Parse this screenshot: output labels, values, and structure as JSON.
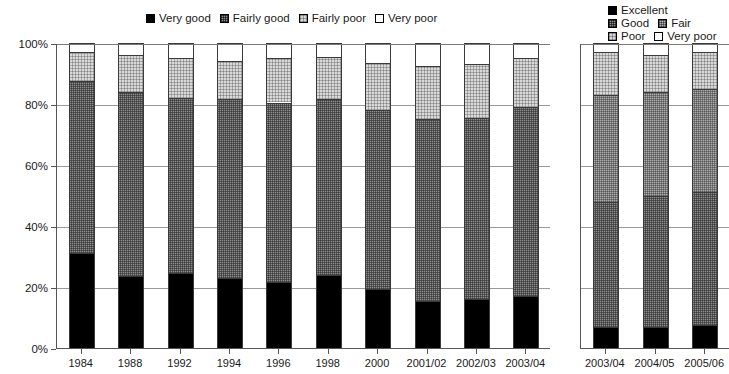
{
  "legends": {
    "left": {
      "name": "quality-rating-legend",
      "items": [
        {
          "label": "Very good",
          "pattern": "solid-black"
        },
        {
          "label": "Fairly good",
          "pattern": "dark-cross-hatch"
        },
        {
          "label": "Fairly poor",
          "pattern": "light-dotted"
        },
        {
          "label": "Very poor",
          "pattern": "white"
        }
      ]
    },
    "right": {
      "name": "condition-rating-legend",
      "rows": [
        [
          {
            "label": "Excellent",
            "pattern": "solid-black"
          }
        ],
        [
          {
            "label": "Good",
            "pattern": "dark-cross-hatch"
          },
          {
            "label": "Fair",
            "pattern": "mid-cross-hatch"
          }
        ],
        [
          {
            "label": "Poor",
            "pattern": "light-dotted"
          },
          {
            "label": "Very poor",
            "pattern": "white"
          }
        ]
      ]
    }
  },
  "axis": {
    "y_ticks": [
      "0%",
      "20%",
      "40%",
      "60%",
      "80%",
      "100%"
    ],
    "y_min": 0,
    "y_max": 100
  },
  "chart_data": [
    {
      "type": "bar",
      "subtype": "stacked-100-percent",
      "panel": "left",
      "title": "",
      "xlabel": "",
      "ylabel": "",
      "ylim": [
        0,
        100
      ],
      "ytick_labels": [
        "0%",
        "20%",
        "40%",
        "60%",
        "80%",
        "100%"
      ],
      "grid": true,
      "legend_position": "top-center",
      "categories": [
        "1984",
        "1988",
        "1992",
        "1994",
        "1996",
        "1998",
        "2000",
        "2001/02",
        "2002/03",
        "2003/04"
      ],
      "series": [
        {
          "name": "Very good",
          "values": [
            31.0,
            23.5,
            24.5,
            23.0,
            21.5,
            24.0,
            19.5,
            15.5,
            16.0,
            17.0
          ]
        },
        {
          "name": "Fairly good",
          "values": [
            56.5,
            60.5,
            57.5,
            58.5,
            59.0,
            57.5,
            58.5,
            59.5,
            59.5,
            62.0
          ]
        },
        {
          "name": "Fairly poor",
          "values": [
            9.5,
            12.0,
            13.0,
            12.5,
            14.5,
            14.0,
            15.5,
            17.5,
            17.5,
            16.0
          ]
        },
        {
          "name": "Very poor",
          "values": [
            3.0,
            4.0,
            5.0,
            6.0,
            5.0,
            4.5,
            6.5,
            7.5,
            7.0,
            5.0
          ]
        }
      ]
    },
    {
      "type": "bar",
      "subtype": "stacked-100-percent",
      "panel": "right",
      "title": "",
      "xlabel": "",
      "ylabel": "",
      "ylim": [
        0,
        100
      ],
      "grid": true,
      "legend_position": "top-right",
      "categories": [
        "2003/04",
        "2004/05",
        "2005/06"
      ],
      "series": [
        {
          "name": "Excellent",
          "values": [
            7.0,
            7.0,
            7.5
          ]
        },
        {
          "name": "Good",
          "values": [
            41.0,
            43.0,
            43.5
          ]
        },
        {
          "name": "Fair",
          "values": [
            35.0,
            34.0,
            34.0
          ]
        },
        {
          "name": "Poor",
          "values": [
            14.0,
            12.0,
            12.0
          ]
        },
        {
          "name": "Very poor",
          "values": [
            3.0,
            4.0,
            3.0
          ]
        }
      ]
    }
  ],
  "colors": {
    "very_good": "#000000",
    "fairly_good": "#8d8d8d",
    "fairly_poor": "#d9d9d9",
    "very_poor": "#ffffff",
    "axis": "#555555",
    "gridline": "#9a9a9a"
  }
}
